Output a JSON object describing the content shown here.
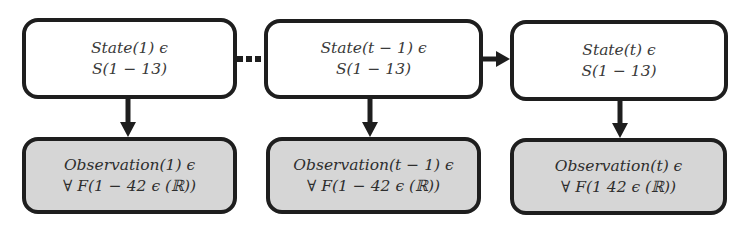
{
  "diagram": {
    "type": "hidden-markov-chain",
    "states": [
      {
        "line1": "State(1) ϵ",
        "line2": "S(1 − 13)"
      },
      {
        "line1": "State(t − 1) ϵ",
        "line2": "S(1 − 13)"
      },
      {
        "line1": "State(t) ϵ",
        "line2": "S(1 − 13)"
      }
    ],
    "observations": [
      {
        "line1": "Observation(1) ϵ",
        "line2": "∀ F(1 − 42 ϵ (ℝ))"
      },
      {
        "line1": "Observation(t − 1) ϵ",
        "line2": "∀ F(1 − 42 ϵ (ℝ))"
      },
      {
        "line1": "Observation(t) ϵ",
        "line2": "∀ F(1   42 ϵ (ℝ))"
      }
    ],
    "edges": [
      {
        "from": "state-1",
        "to": "state-t-minus-1",
        "style": "dotted"
      },
      {
        "from": "state-t-minus-1",
        "to": "state-t",
        "style": "arrow"
      },
      {
        "from": "state-1",
        "to": "observation-1",
        "style": "arrow"
      },
      {
        "from": "state-t-minus-1",
        "to": "observation-t-minus-1",
        "style": "arrow"
      },
      {
        "from": "state-t",
        "to": "observation-t",
        "style": "arrow"
      }
    ],
    "colors": {
      "border": "#1e1e1e",
      "state_fill": "#ffffff",
      "observation_fill": "#d6d6d6"
    }
  }
}
